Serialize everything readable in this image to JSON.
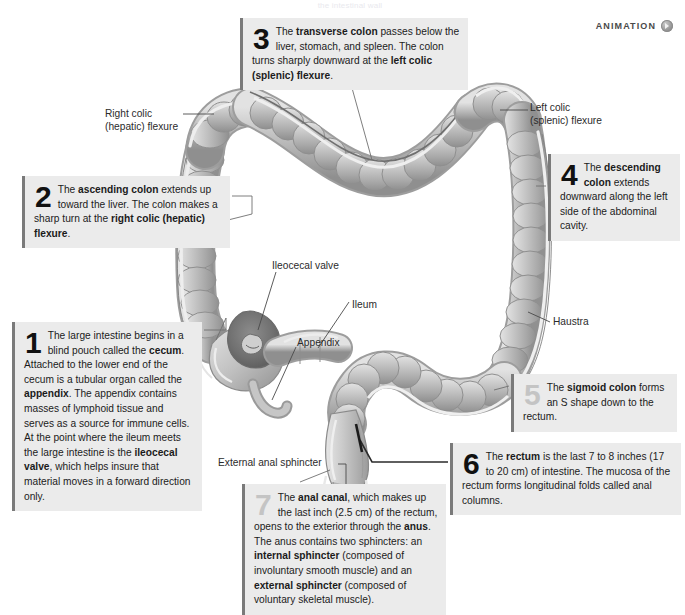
{
  "page": {
    "top_faint_text": "the intestinal wall",
    "badge": {
      "label": "ANIMATION",
      "icon": "play-orb-icon"
    }
  },
  "callouts": [
    {
      "id": 1,
      "number": "1",
      "number_style": "dark",
      "html": "The large intestine begins in a blind pouch called the <b>cecum</b>. Attached to the lower end of the cecum is a tubular organ called the <b>appendix</b>. The appendix contains masses of lymphoid tissue and serves as a source for immune cells. At the point where the ileum meets the large intestine is the <b>ileocecal valve</b>, which helps insure that material moves in a forward direction only.",
      "text": "The large intestine begins in a blind pouch called the cecum. Attached to the lower end of the cecum is a tubular organ called the appendix. The appendix contains masses of lymphoid tissue and serves as a source for immune cells. At the point where the ileum meets the large intestine is the ileocecal valve, which helps insure that material moves in a forward direction only."
    },
    {
      "id": 2,
      "number": "2",
      "number_style": "dark",
      "html": "The <b>ascending colon</b> extends up toward the liver. The colon makes a sharp turn at the <b>right colic (hepatic) flexure</b>.",
      "text": "The ascending colon extends up toward the liver. The colon makes a sharp turn at the right colic (hepatic) flexure."
    },
    {
      "id": 3,
      "number": "3",
      "number_style": "dark",
      "html": "The <b>transverse colon</b> passes below the liver, stomach, and spleen. The colon turns sharply downward at the <b>left colic (splenic) flexure</b>.",
      "text": "The transverse colon passes below the liver, stomach, and spleen. The colon turns sharply downward at the left colic (splenic) flexure."
    },
    {
      "id": 4,
      "number": "4",
      "number_style": "dark",
      "html": "The <b>descending colon</b> extends downward along the left side of the abdominal cavity.",
      "text": "The descending colon extends downward along the left side of the abdominal cavity."
    },
    {
      "id": 5,
      "number": "5",
      "number_style": "light",
      "html": "The <b>sigmoid colon</b> forms an S shape down to the rectum.",
      "text": "The sigmoid colon forms an S shape down to the rectum."
    },
    {
      "id": 6,
      "number": "6",
      "number_style": "dark",
      "html": "The <b>rectum</b> is the last 7 to 8 inches (17 to 20 cm) of intestine. The mucosa of the rectum forms longitudinal folds called anal columns.",
      "text": "The rectum is the last 7 to 8 inches (17 to 20 cm) of intestine. The mucosa of the rectum forms longitudinal folds called anal columns."
    },
    {
      "id": 7,
      "number": "7",
      "number_style": "light",
      "html": "The <b>anal canal</b>, which makes up the last inch (2.5 cm) of the rectum, opens to the exterior through the <b>anus</b>. The anus contains two sphincters: an <b>internal sphincter</b> (composed of involuntary smooth muscle) and an <b>external sphincter</b> (composed of voluntary skeletal muscle).",
      "text": "The anal canal, which makes up the last inch (2.5 cm) of the rectum, opens to the exterior through the anus. The anus contains two sphincters: an internal sphincter (composed of involuntary smooth muscle) and an external sphincter (composed of voluntary skeletal muscle)."
    }
  ],
  "labels": {
    "right_colic": "Right colic\n(hepatic) flexure",
    "right_colic_line1": "Right colic",
    "right_colic_line2": "(hepatic) flexure",
    "left_colic_line1": "Left colic",
    "left_colic_line2": "(splenic) flexure",
    "ileocecal_valve": "Ileocecal valve",
    "ileum": "Ileum",
    "appendix": "Appendix",
    "haustra": "Haustra",
    "external_anal_sphincter": "External anal sphincter"
  },
  "colors": {
    "callout_bg": "#ebebeb",
    "callout_rule": "#7a7a7a",
    "organ_mid": "#b9b9b9",
    "organ_light": "#dcdcdc",
    "organ_dark": "#8e8e8e",
    "leader_line": "#4a4a4a",
    "text": "#1b1b1b"
  }
}
